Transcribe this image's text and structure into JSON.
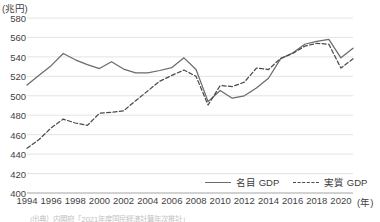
{
  "unit_label": "(兆円)",
  "x_axis_unit": "(年)",
  "legend": {
    "nominal": "名目 GDP",
    "real": "実質 GDP"
  },
  "source_note": "(出典）内閣府「2021年度国民経済計算年次推計」",
  "chart_data": {
    "type": "line",
    "title": "",
    "xlabel": "(年)",
    "ylabel": "(兆円)",
    "ylim": [
      400,
      580
    ],
    "xlim": [
      1994,
      2021
    ],
    "grid": true,
    "legend_position": "bottom-right",
    "ytick_values": [
      580,
      560,
      540,
      520,
      500,
      480,
      460,
      440,
      420,
      400
    ],
    "xtick_values": [
      1994,
      1996,
      1998,
      2000,
      2002,
      2004,
      2006,
      2008,
      2010,
      2012,
      2014,
      2016,
      2018,
      2020
    ],
    "x": [
      1994,
      1995,
      1996,
      1997,
      1998,
      1999,
      2000,
      2001,
      2002,
      2003,
      2004,
      2005,
      2006,
      2007,
      2008,
      2009,
      2010,
      2011,
      2012,
      2013,
      2014,
      2015,
      2016,
      2017,
      2018,
      2019,
      2020,
      2021
    ],
    "series": [
      {
        "name": "名目 GDP",
        "style": "solid",
        "color": "#6b6b6b",
        "values": [
          511.0,
          521.0,
          531.0,
          543.5,
          537.0,
          532.0,
          528.0,
          535.0,
          527.5,
          523.5,
          523.5,
          526.0,
          529.0,
          539.0,
          527.0,
          494.0,
          505.5,
          497.5,
          500.0,
          508.0,
          518.0,
          538.0,
          544.0,
          553.0,
          556.0,
          558.0,
          539.0,
          549.0
        ]
      },
      {
        "name": "実質 GDP",
        "style": "dashed",
        "color": "#4a4a4a",
        "values": [
          446.0,
          455.0,
          467.0,
          476.0,
          472.0,
          469.5,
          482.0,
          483.0,
          484.5,
          495.0,
          505.0,
          515.0,
          521.0,
          526.5,
          520.0,
          490.5,
          510.5,
          509.5,
          514.0,
          528.5,
          527.0,
          538.5,
          543.5,
          551.0,
          554.0,
          553.0,
          528.5,
          538.0
        ]
      }
    ]
  }
}
